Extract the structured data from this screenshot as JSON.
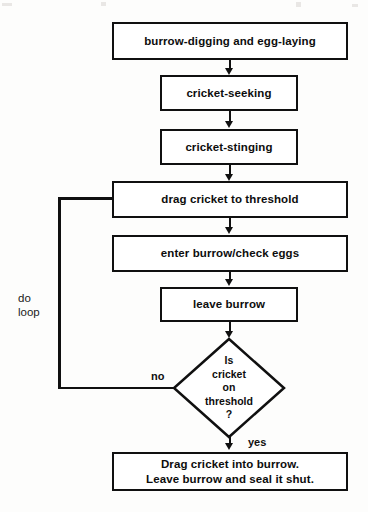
{
  "figure": {
    "ink_color": "#101010",
    "background_color": "#fdfdfc"
  },
  "nodes": [
    {
      "id": "burrow-digging",
      "shape": "process",
      "label": "burrow-digging and egg-laying"
    },
    {
      "id": "cricket-seeking",
      "shape": "process",
      "label": "cricket-seeking"
    },
    {
      "id": "cricket-stinging",
      "shape": "process",
      "label": "cricket-stinging"
    },
    {
      "id": "drag-threshold",
      "shape": "process",
      "label": "drag cricket to threshold"
    },
    {
      "id": "enter-burrow",
      "shape": "process",
      "label": "enter burrow/check eggs"
    },
    {
      "id": "leave-burrow",
      "shape": "process",
      "label": "leave burrow"
    },
    {
      "id": "decision",
      "shape": "decision",
      "lines": [
        "Is",
        "cricket",
        "on",
        "threshold",
        "?"
      ]
    },
    {
      "id": "final",
      "shape": "process",
      "line1": "Drag cricket into burrow.",
      "line2": "Leave burrow and seal it shut."
    }
  ],
  "edge_labels": {
    "no": "no",
    "yes": "yes",
    "loop": "do\nloop"
  }
}
